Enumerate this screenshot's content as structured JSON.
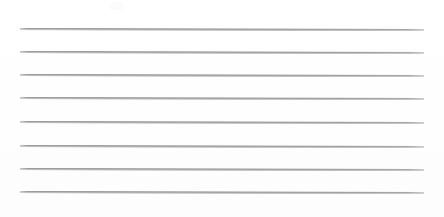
{
  "document": {
    "type": "ruled-paper-scan",
    "title": "Blank ruled paper",
    "background_color": "#ffffff",
    "rule_color": "#8d8d8d",
    "text_content": "",
    "page_width": 444,
    "page_height": 217
  },
  "rules": {
    "count": 8,
    "left_x": 20,
    "right_x": 424,
    "slant_px": 1,
    "thickness_px": 1,
    "lines": [
      {
        "index": 1,
        "y": 28
      },
      {
        "index": 2,
        "y": 51
      },
      {
        "index": 3,
        "y": 74
      },
      {
        "index": 4,
        "y": 97
      },
      {
        "index": 5,
        "y": 121
      },
      {
        "index": 6,
        "y": 145
      },
      {
        "index": 7,
        "y": 168
      },
      {
        "index": 8,
        "y": 191
      }
    ]
  },
  "artifacts": {
    "scan_smudge": {
      "x": 110,
      "y": 2,
      "width": 13,
      "height": 8
    }
  }
}
